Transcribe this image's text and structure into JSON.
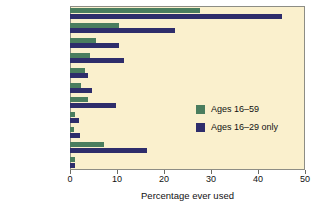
{
  "chart_data": {
    "type": "bar",
    "orientation": "horizontal",
    "title": "",
    "xlabel": "Percentage ever used",
    "ylabel": "",
    "xlim": [
      0,
      50
    ],
    "xticks": [
      0,
      10,
      20,
      30,
      40,
      50
    ],
    "grid": false,
    "legend_position": "center-right",
    "categories": [
      "Cannabis",
      "Amphetamine",
      "LSD",
      "Ecstasy",
      "Benzodiazepines",
      "Solvents",
      "Cocaine",
      "Crack cocaine",
      "Heroin",
      "Poppers",
      "Steroids"
    ],
    "series": [
      {
        "name": "Ages 16–59",
        "color": "#4a7d5e",
        "values": [
          27.7,
          10.5,
          5.5,
          4.2,
          3.1,
          2.4,
          3.9,
          1.0,
          0.9,
          7.3,
          1.0
        ]
      },
      {
        "name": "Ages 16–29 only",
        "color": "#2e2d6b",
        "values": [
          45.0,
          22.3,
          10.5,
          11.5,
          3.8,
          4.7,
          9.8,
          1.9,
          2.1,
          16.4,
          1.1
        ]
      }
    ]
  },
  "colors": {
    "plot_background": "#faf0cd",
    "page_background": "#ffffff",
    "frame": "#8d8d85",
    "series_a": "#4a7d5e",
    "series_b": "#2e2d6b",
    "text": "#111111"
  }
}
